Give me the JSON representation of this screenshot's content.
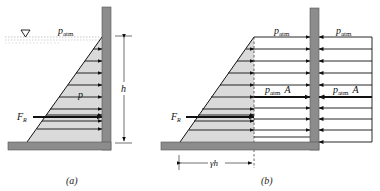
{
  "figure_a": {
    "caption": "(a)",
    "labels": {
      "free_surface_pressure": "p",
      "free_surface_pressure_sub": "atm",
      "pressure": "p",
      "resultant_force": "F",
      "resultant_force_sub": "R",
      "depth": "h"
    },
    "free_surface_symbol": "▽"
  },
  "figure_b": {
    "caption": "(b)",
    "labels": {
      "left_top_pressure": "p",
      "left_top_pressure_sub": "atm",
      "right_top_pressure": "p",
      "right_top_pressure_sub": "atm",
      "left_mid_force": "p",
      "left_mid_force_sub": "atm",
      "left_mid_force_area": "A",
      "right_mid_force": "p",
      "right_mid_force_sub": "atm",
      "right_mid_force_area": "A",
      "resultant_force": "F",
      "resultant_force_sub": "R",
      "base_width": "γh"
    }
  },
  "colors": {
    "wall": "#8c8c8c",
    "pressure_fill": "#dadada",
    "line": "#111111",
    "water_dots": "#b8b8b8"
  }
}
